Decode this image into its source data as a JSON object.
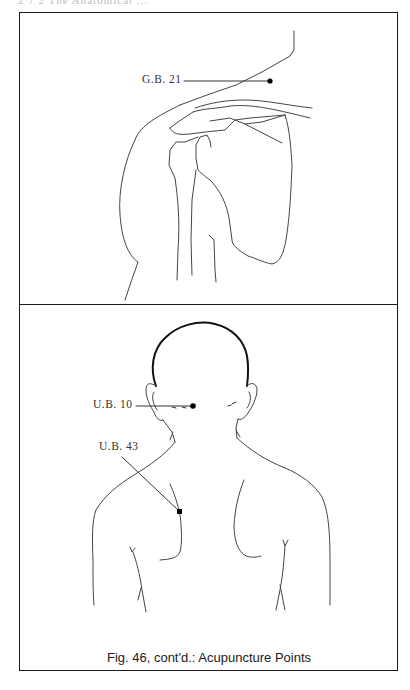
{
  "page": {
    "header_text": "2 7 2    The Anatomical ..."
  },
  "panels": [
    {
      "id": "shoulder-lateral",
      "description": "Right shoulder and scapula outline",
      "points": [
        {
          "label": "G.B. 21",
          "dot": [
            270,
            81
          ]
        }
      ]
    },
    {
      "id": "upper-back-posterior",
      "description": "Posterior view of head, neck and upper back",
      "points": [
        {
          "label": "U.B. 10",
          "dot": [
            193,
            406
          ]
        },
        {
          "label": "U.B. 43",
          "dot": [
            179,
            511
          ]
        }
      ]
    }
  ],
  "labels": {
    "gb21": "G.B. 21",
    "ub10": "U.B. 10",
    "ub43": "U.B. 43"
  },
  "caption": "Fig. 46, cont'd.: Acupuncture Points",
  "colors": {
    "line": "#444444",
    "frame": "#1a1a1a",
    "dot": "#000000"
  }
}
